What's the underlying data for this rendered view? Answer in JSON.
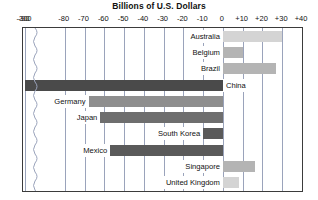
{
  "chart_data": {
    "type": "bar",
    "orientation": "horizontal",
    "title": "Billions of U.S. Dollars",
    "xlabel": "",
    "ylabel": "",
    "xlim": [
      -95,
      40
    ],
    "grid": true,
    "legend": "none",
    "axis_break": {
      "present": true,
      "at": -92,
      "note": "broken axis between -300 and -90"
    },
    "tick_labels": [
      "-300",
      "-90",
      "-80",
      "-70",
      "-60",
      "-50",
      "-40",
      "-30",
      "-20",
      "-10",
      "0",
      "+10",
      "+20",
      "+30",
      "+40"
    ],
    "tick_values": [
      -300,
      -90,
      -80,
      -70,
      -60,
      -50,
      -40,
      -30,
      -20,
      -10,
      0,
      10,
      20,
      30,
      40
    ],
    "categories": [
      "Australia",
      "Belgium",
      "Brazil",
      "China",
      "Germany",
      "Japan",
      "South Korea",
      "Mexico",
      "Singapore",
      "United Kingdom"
    ],
    "values": [
      30,
      10,
      27,
      -300,
      -68,
      -62,
      -10,
      -57,
      16,
      8
    ],
    "value_colors": [
      "#d4d4d4",
      "#b4b4b4",
      "#b4b4b4",
      "#4a4a4a",
      "#8e8e8e",
      "#6e6e6e",
      "#5a5a5a",
      "#5a5a5a",
      "#b4b4b4",
      "#d4d4d4"
    ],
    "series": [
      {
        "name": "Trade balance",
        "points": [
          {
            "category": "Australia",
            "value": 30,
            "color": "#d4d4d4",
            "label_side": "left"
          },
          {
            "category": "Belgium",
            "value": 10,
            "color": "#b4b4b4",
            "label_side": "left"
          },
          {
            "category": "Brazil",
            "value": 27,
            "color": "#b4b4b4",
            "label_side": "left"
          },
          {
            "category": "China",
            "value": -300,
            "color": "#4a4a4a",
            "label_side": "right"
          },
          {
            "category": "Germany",
            "value": -68,
            "color": "#8e8e8e",
            "label_side": "left"
          },
          {
            "category": "Japan",
            "value": -62,
            "color": "#6e6e6e",
            "label_side": "left"
          },
          {
            "category": "South Korea",
            "value": -10,
            "color": "#5a5a5a",
            "label_side": "left"
          },
          {
            "category": "Mexico",
            "value": -57,
            "color": "#5a5a5a",
            "label_side": "left"
          },
          {
            "category": "Singapore",
            "value": 16,
            "color": "#b4b4b4",
            "label_side": "left"
          },
          {
            "category": "United Kingdom",
            "value": 8,
            "color": "#d4d4d4",
            "label_side": "left"
          }
        ]
      }
    ]
  },
  "colors": {
    "frame": "#3b3b3b",
    "grid": "#9aa3bb",
    "background": "#ffffff",
    "text": "#111111"
  }
}
